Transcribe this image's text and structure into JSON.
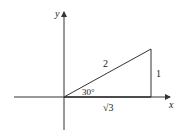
{
  "diagram": {
    "type": "right-triangle-unit-circle",
    "axes": {
      "x_label": "x",
      "y_label": "y"
    },
    "triangle": {
      "hypotenuse_label": "2",
      "opposite_label": "1",
      "adjacent_label": "√3",
      "angle_label": "30°"
    },
    "colors": {
      "stroke": "#333333",
      "text": "#222222",
      "background": "#ffffff"
    }
  }
}
